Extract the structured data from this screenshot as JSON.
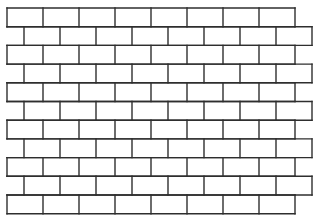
{
  "pattern": {
    "name": "running-bond-brick-wall",
    "line_color": "#2e2e2e",
    "background": "#ffffff",
    "line_width": 1.4,
    "origin_x": 7,
    "origin_y": 8,
    "brick_width": 36,
    "row_height": 18.7,
    "rows": 11,
    "bricks_per_row": 8,
    "odd_row_offset": 17
  }
}
